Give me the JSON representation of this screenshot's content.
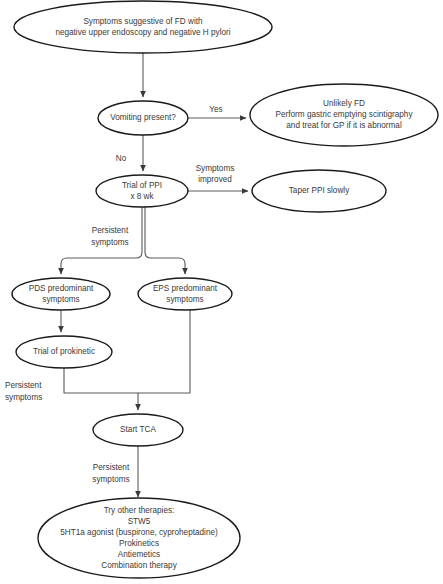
{
  "diagram": {
    "canvas": {
      "width": 443,
      "height": 584
    },
    "colors": {
      "background": "#ffffff",
      "node_stroke": "#1a1a1a",
      "node_fill": "#ffffff",
      "text": "#3a3a3a",
      "edge_stroke": "#5a5a5a"
    },
    "nodes": [
      {
        "id": "start",
        "shape": "ellipse",
        "cx": 143,
        "cy": 27,
        "rx": 129,
        "ry": 26,
        "lines": [
          "Symptoms suggestive of FD with",
          "negative upper endoscopy and negative H pylori"
        ]
      },
      {
        "id": "vomiting",
        "shape": "ellipse",
        "cx": 143,
        "cy": 118,
        "rx": 45,
        "ry": 17,
        "lines": [
          "Vomiting present?"
        ]
      },
      {
        "id": "unlikely-fd",
        "shape": "ellipse",
        "cx": 344,
        "cy": 115,
        "rx": 94,
        "ry": 31,
        "lines": [
          "Unlikely FD",
          "Perform gastric emptying scintigraphy",
          "and treat for GP if it is abnormal"
        ]
      },
      {
        "id": "trial-ppi",
        "shape": "ellipse",
        "cx": 142,
        "cy": 191,
        "rx": 46,
        "ry": 16,
        "lines": [
          "Trial of PPI",
          "x 8 wk"
        ]
      },
      {
        "id": "taper-ppi",
        "shape": "ellipse",
        "cx": 319,
        "cy": 191,
        "rx": 67,
        "ry": 21,
        "lines": [
          "Taper PPI slowly"
        ]
      },
      {
        "id": "pds",
        "shape": "ellipse",
        "cx": 61,
        "cy": 294,
        "rx": 49,
        "ry": 16,
        "lines": [
          "PDS predominant",
          "symptoms"
        ]
      },
      {
        "id": "eps",
        "shape": "ellipse",
        "cx": 185,
        "cy": 294,
        "rx": 47,
        "ry": 16,
        "lines": [
          "EPS predominant",
          "symptoms"
        ]
      },
      {
        "id": "prokinetic",
        "shape": "ellipse",
        "cx": 64,
        "cy": 352,
        "rx": 48,
        "ry": 16,
        "lines": [
          "Trial of prokinetic"
        ]
      },
      {
        "id": "start-tca",
        "shape": "ellipse",
        "cx": 138,
        "cy": 430,
        "rx": 45,
        "ry": 16,
        "lines": [
          "Start TCA"
        ]
      },
      {
        "id": "other-therapies",
        "shape": "ellipse",
        "cx": 139,
        "cy": 538,
        "rx": 101,
        "ry": 40,
        "lines": [
          "Try other therapies:",
          "STW5",
          "5HT1a agonist (buspirone, cyproheptadine)",
          "Prokinetics",
          "Antiemetics",
          "Combination therapy"
        ]
      }
    ],
    "edges": [
      {
        "id": "start-to-vomiting",
        "from": "start",
        "to": "vomiting",
        "path": "M 143 53 L 143 97",
        "arrow": true,
        "label": null
      },
      {
        "id": "vomiting-to-unlikely",
        "from": "vomiting",
        "to": "unlikely-fd",
        "path": "M 188 118 L 246 118",
        "arrow": true,
        "label": "Yes"
      },
      {
        "id": "vomiting-to-trial",
        "from": "vomiting",
        "to": "trial-ppi",
        "path": "M 143 135 L 143 171",
        "arrow": true,
        "label": "No"
      },
      {
        "id": "trial-to-taper",
        "from": "trial-ppi",
        "to": "taper-ppi",
        "path": "M 188 191 L 248 191",
        "arrow": true,
        "label": "Symptoms\nimproved"
      },
      {
        "id": "trial-to-pds",
        "from": "trial-ppi",
        "to": "pds",
        "path": "M 142 207 L 142 252 Q 142 258 136 258 L 67 258 Q 61 258 61 264 L 61 274",
        "arrow": true,
        "label": "Persistent\nsymptoms"
      },
      {
        "id": "trial-to-eps",
        "from": "trial-ppi",
        "to": "eps",
        "path": "M 145 207 L 145 252 Q 145 258 151 258 L 179 258 Q 185 258 185 264 L 185 274",
        "arrow": true,
        "label": null
      },
      {
        "id": "pds-to-prokinetic",
        "from": "pds",
        "to": "prokinetic",
        "path": "M 61 310 L 61 332",
        "arrow": true,
        "label": null
      },
      {
        "id": "prokinetic-to-tca",
        "from": "prokinetic",
        "to": "start-tca",
        "path": "M 64 368 L 64 393 L 138 393 L 138 410",
        "arrow": true,
        "label": "Persistent\nsymptoms"
      },
      {
        "id": "eps-to-tca",
        "from": "eps",
        "to": "start-tca",
        "path": "M 190 310 L 190 393 L 138 393",
        "arrow": false,
        "label": null
      },
      {
        "id": "tca-to-other",
        "from": "start-tca",
        "to": "other-therapies",
        "path": "M 138 446 L 138 497",
        "arrow": true,
        "label": "Persistent\nsymptoms"
      }
    ],
    "edge_labels": [
      {
        "id": "label-yes",
        "text": "Yes",
        "x": 216,
        "y": 112,
        "align": "center"
      },
      {
        "id": "label-no",
        "text": "No",
        "x": 121,
        "y": 161,
        "align": "center"
      },
      {
        "id": "label-symptoms-improved-1",
        "text": "Symptoms",
        "x": 215,
        "y": 171,
        "align": "center"
      },
      {
        "id": "label-symptoms-improved-2",
        "text": "improved",
        "x": 215,
        "y": 182,
        "align": "center"
      },
      {
        "id": "label-persistent-1a",
        "text": "Persistent",
        "x": 110,
        "y": 233,
        "align": "center"
      },
      {
        "id": "label-persistent-1b",
        "text": "symptoms",
        "x": 110,
        "y": 245,
        "align": "center"
      },
      {
        "id": "label-persistent-2a",
        "text": "Persistent",
        "x": 5,
        "y": 388,
        "align": "left"
      },
      {
        "id": "label-persistent-2b",
        "text": "symptoms",
        "x": 5,
        "y": 400,
        "align": "left"
      },
      {
        "id": "label-persistent-3a",
        "text": "Persistent",
        "x": 111,
        "y": 470,
        "align": "center"
      },
      {
        "id": "label-persistent-3b",
        "text": "symptoms",
        "x": 111,
        "y": 482,
        "align": "center"
      }
    ]
  }
}
